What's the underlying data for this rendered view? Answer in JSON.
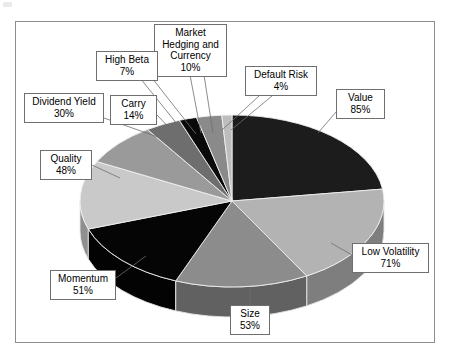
{
  "figure": {
    "frame": {
      "border_color": "#8e8e8e"
    },
    "background": "#ffffff"
  },
  "chart_data": {
    "type": "pie",
    "title": "",
    "subtitle": "",
    "xlabel": "",
    "ylabel": "",
    "legend_position": "callout-labels",
    "grid": false,
    "value_suffix": "%",
    "note": "Values are individual percentage ratings per factor; they do not sum to 100.",
    "categories": [
      "Value",
      "Low Volatility",
      "Size",
      "Momentum",
      "Quality",
      "Dividend Yield",
      "Carry",
      "High Beta",
      "Market Hedging and Currency",
      "Default Risk"
    ],
    "values": [
      85,
      71,
      53,
      51,
      48,
      30,
      14,
      7,
      10,
      4
    ],
    "slices": [
      {
        "label": "Value",
        "value": 85,
        "value_text": "85%",
        "color": "#1c1c1c",
        "side_color": "#111111"
      },
      {
        "label": "Low Volatility",
        "value": 71,
        "value_text": "71%",
        "color": "#b3b3b3",
        "side_color": "#7e7e7e"
      },
      {
        "label": "Size",
        "value": 53,
        "value_text": "53%",
        "color": "#8c8c8c",
        "side_color": "#616161"
      },
      {
        "label": "Momentum",
        "value": 51,
        "value_text": "51%",
        "color": "#050505",
        "side_color": "#030303"
      },
      {
        "label": "Quality",
        "value": 48,
        "value_text": "48%",
        "color": "#c9c9c9",
        "side_color": "#8f8f8f"
      },
      {
        "label": "Dividend Yield",
        "value": 30,
        "value_text": "30%",
        "color": "#9a9a9a",
        "side_color": "#6b6b6b"
      },
      {
        "label": "Carry",
        "value": 14,
        "value_text": "14%",
        "color": "#6e6e6e",
        "side_color": "#4d4d4d"
      },
      {
        "label": "High Beta",
        "value": 7,
        "value_text": "7%",
        "color": "#0a0a0a",
        "side_color": "#060606"
      },
      {
        "label": "Market Hedging and Currency",
        "value": 10,
        "value_text": "10%",
        "color": "#8a8a8a",
        "side_color": "#606060"
      },
      {
        "label": "Default Risk",
        "value": 4,
        "value_text": "4%",
        "color": "#bdbdbd",
        "side_color": "#858585"
      }
    ]
  },
  "callouts": {
    "market_hedging": {
      "line1": "Market",
      "line2": "Hedging and",
      "line3": "Currency",
      "value": "10%"
    },
    "high_beta": {
      "label": "High Beta",
      "value": "7%"
    },
    "default_risk": {
      "label": "Default Risk",
      "value": "4%"
    },
    "value": {
      "label": "Value",
      "value": "85%"
    },
    "dividend_yield": {
      "label": "Dividend Yield",
      "value": "30%"
    },
    "carry": {
      "label": "Carry",
      "value": "14%"
    },
    "quality": {
      "label": "Quality",
      "value": "48%"
    },
    "low_volatility": {
      "label": "Low Volatility",
      "value": "71%"
    },
    "momentum": {
      "label": "Momentum",
      "value": "51%"
    },
    "size": {
      "label": "Size",
      "value": "53%"
    }
  }
}
